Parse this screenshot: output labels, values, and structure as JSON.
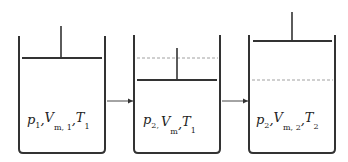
{
  "diagram": {
    "colors": {
      "stroke": "#333333",
      "dashed_line": "#888888",
      "text": "#222222"
    },
    "states": [
      {
        "id": "state-1",
        "label": {
          "p": "p",
          "p_sub": "1",
          "sep1": ",",
          "v": "V",
          "v_sub": "m, 1",
          "sep2": ",",
          "t": "T",
          "t_sub": "1"
        },
        "has_dashed_reference": false
      },
      {
        "id": "state-2",
        "label": {
          "p": "p",
          "p_sub": "2,",
          "sep1": "",
          "v": "V",
          "v_sub": "m",
          "sep2": ",",
          "t": "T",
          "t_sub": "1"
        },
        "has_dashed_reference": true
      },
      {
        "id": "state-3",
        "label": {
          "p": "p",
          "p_sub": "2",
          "sep1": ",",
          "v": "V",
          "v_sub": "m, 2",
          "sep2": ",",
          "t": "T",
          "t_sub": "2"
        },
        "has_dashed_reference": true
      }
    ],
    "arrows": [
      {
        "from": "state-1",
        "to": "state-2"
      },
      {
        "from": "state-2",
        "to": "state-3"
      }
    ]
  }
}
